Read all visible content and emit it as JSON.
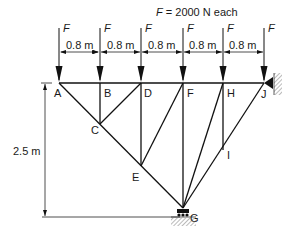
{
  "title": "F = 2000 N each",
  "load_label": "F",
  "spacing_label": "0.8 m",
  "height_label": "2.5 m",
  "nodes": {
    "A": "A",
    "B": "B",
    "C": "C",
    "D": "D",
    "E": "E",
    "F": "F",
    "G": "G",
    "H": "H",
    "I": "I",
    "J": "J"
  },
  "loads": [
    "F",
    "F",
    "F",
    "F",
    "F",
    "F"
  ],
  "spacings": [
    "0.8 m",
    "0.8 m",
    "0.8 m",
    "0.8 m",
    "0.8 m"
  ],
  "supports": {
    "J": "pin-wall",
    "G": "roller-ground"
  }
}
